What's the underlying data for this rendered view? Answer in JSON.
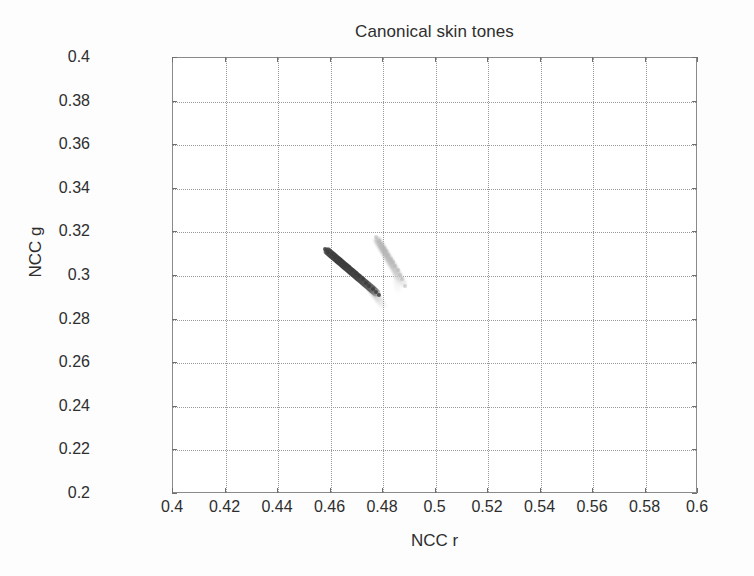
{
  "chart_data": {
    "type": "scatter",
    "title": "Canonical skin tones",
    "xlabel": "NCC r",
    "ylabel": "NCC g",
    "xlim": [
      0.4,
      0.6
    ],
    "ylim": [
      0.2,
      0.4
    ],
    "xticks": [
      0.4,
      0.42,
      0.44,
      0.46,
      0.48,
      0.5,
      0.52,
      0.54,
      0.56,
      0.58,
      0.6
    ],
    "yticks": [
      0.2,
      0.22,
      0.24,
      0.26,
      0.28,
      0.3,
      0.32,
      0.34,
      0.36,
      0.38,
      0.4
    ],
    "xticklabels": [
      "0.4",
      "0.42",
      "0.44",
      "0.46",
      "0.48",
      "0.5",
      "0.52",
      "0.54",
      "0.56",
      "0.58",
      "0.6"
    ],
    "yticklabels": [
      "0.2",
      "0.22",
      "0.24",
      "0.26",
      "0.28",
      "0.3",
      "0.32",
      "0.34",
      "0.36",
      "0.38",
      "0.4"
    ],
    "grid": true,
    "grid_style": "dotted",
    "grid_color": "#9a9a9a",
    "legend": null,
    "background": "#ffffff",
    "series": [
      {
        "name": "dark skin tone locus",
        "color": "#3c3c3c",
        "shape": "elongated-streak",
        "x_start": 0.458,
        "y_start": 0.3125,
        "x_end": 0.4785,
        "y_end": 0.2915,
        "thickness": 0.0035,
        "points": [
          [
            0.458,
            0.3125
          ],
          [
            0.4592,
            0.3112
          ],
          [
            0.4605,
            0.31
          ],
          [
            0.4618,
            0.3088
          ],
          [
            0.4631,
            0.3076
          ],
          [
            0.4644,
            0.3064
          ],
          [
            0.4657,
            0.3052
          ],
          [
            0.467,
            0.3039
          ],
          [
            0.4683,
            0.3026
          ],
          [
            0.4696,
            0.3012
          ],
          [
            0.4709,
            0.2998
          ],
          [
            0.4722,
            0.2984
          ],
          [
            0.4735,
            0.297
          ],
          [
            0.4748,
            0.2955
          ],
          [
            0.4761,
            0.294
          ],
          [
            0.4774,
            0.2926
          ],
          [
            0.4785,
            0.2915
          ]
        ]
      },
      {
        "name": "light skin tone locus",
        "color": "#b4b4b4",
        "shape": "elongated-streak",
        "x_start": 0.4775,
        "y_start": 0.3178,
        "x_end": 0.4885,
        "y_end": 0.2955,
        "thickness": 0.0032,
        "points": [
          [
            0.4775,
            0.3178
          ],
          [
            0.4784,
            0.3162
          ],
          [
            0.4793,
            0.3146
          ],
          [
            0.4802,
            0.313
          ],
          [
            0.4811,
            0.3114
          ],
          [
            0.482,
            0.3097
          ],
          [
            0.4829,
            0.308
          ],
          [
            0.4838,
            0.3063
          ],
          [
            0.4847,
            0.3045
          ],
          [
            0.4856,
            0.3026
          ],
          [
            0.4865,
            0.3006
          ],
          [
            0.4874,
            0.2984
          ],
          [
            0.4885,
            0.2955
          ]
        ]
      }
    ]
  }
}
